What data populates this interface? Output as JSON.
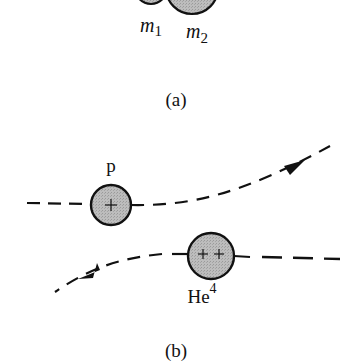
{
  "figure": {
    "panel_a": {
      "label": "(a)",
      "particles": [
        {
          "name": "m",
          "subscript": "1"
        },
        {
          "name": "m",
          "subscript": "2"
        }
      ]
    },
    "panel_b": {
      "label": "(b)",
      "proton": {
        "label": "p",
        "charge": "+"
      },
      "helium": {
        "label": "He",
        "superscript": "4",
        "charge": "++"
      },
      "trajectories": [
        {
          "particle": "proton",
          "direction": "left-to-right, deflected upward"
        },
        {
          "particle": "helium",
          "direction": "right-to-left, deflected downward"
        }
      ]
    },
    "colors": {
      "particle_fill": "#b4b4b4",
      "stroke": "#111111",
      "background": "#ffffff"
    }
  }
}
